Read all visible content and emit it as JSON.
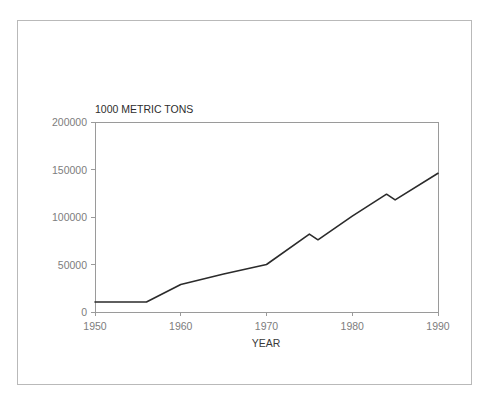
{
  "figure": {
    "border_color": "#b9b9b9",
    "background": "#ffffff"
  },
  "chart_data": {
    "type": "line",
    "title": "1000 METRIC TONS",
    "xlabel": "YEAR",
    "ylabel": "",
    "xlim": [
      1950,
      1990
    ],
    "ylim": [
      0,
      200000
    ],
    "grid": false,
    "legend": null,
    "line_color": "#2b2b2b",
    "xticks": [
      1950,
      1960,
      1970,
      1980,
      1990
    ],
    "xtick_labels": [
      "1950",
      "1960",
      "1970",
      "1980",
      "1990"
    ],
    "yticks": [
      0,
      50000,
      100000,
      150000,
      200000
    ],
    "ytick_labels": [
      "0",
      "50000",
      "100000",
      "150000",
      "200000"
    ],
    "series": [
      {
        "name": "production",
        "x": [
          1950,
          1956,
          1960,
          1965,
          1970,
          1975,
          1976,
          1980,
          1984,
          1985,
          1990
        ],
        "values": [
          10500,
          10500,
          29000,
          40000,
          50000,
          82000,
          76000,
          101000,
          124000,
          118000,
          146000
        ]
      }
    ]
  }
}
